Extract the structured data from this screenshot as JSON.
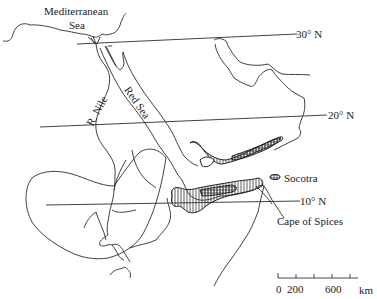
{
  "map": {
    "labels": {
      "sea_med_line1": "Mediterranean",
      "sea_med_line2": "Sea",
      "nile": "R. Nile",
      "red_sea": "Red Sea",
      "socotra": "Socotra",
      "cape": "Cape of Spices"
    },
    "latitudes": [
      {
        "label": "30° N"
      },
      {
        "label": "20° N"
      },
      {
        "label": "10° N"
      }
    ],
    "scale_bar": {
      "ticks": [
        "0",
        "200",
        "600"
      ],
      "unit": "km"
    },
    "colors": {
      "line": "#2b2b2b",
      "hatch": "#333333",
      "background": "#ffffff"
    }
  }
}
